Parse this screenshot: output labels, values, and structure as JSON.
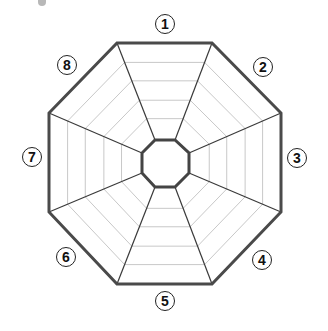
{
  "diagram": {
    "type": "octagonal radar chart template (blank)",
    "center": [
      165,
      163
    ],
    "outer_vertices": [
      [
        117,
        43
      ],
      [
        212,
        43
      ],
      [
        281,
        113
      ],
      [
        281,
        212
      ],
      [
        212,
        284
      ],
      [
        117,
        284
      ],
      [
        49,
        212
      ],
      [
        49,
        113
      ]
    ],
    "inner_vertices": [
      [
        155,
        140
      ],
      [
        175,
        140
      ],
      [
        189,
        153
      ],
      [
        189,
        173
      ],
      [
        175,
        187
      ],
      [
        155,
        187
      ],
      [
        142,
        173
      ],
      [
        142,
        153
      ]
    ],
    "grid_fractions": [
      0.22,
      0.41,
      0.61,
      0.8
    ],
    "colors": {
      "outline": "#4a4a4a",
      "spoke": "#3a3a3a",
      "grid": "#c8c8c8",
      "inner": "#444444"
    },
    "axes": [
      {
        "label": "①",
        "pos": [
          165,
          24
        ]
      },
      {
        "label": "②",
        "pos": [
          263,
          67
        ]
      },
      {
        "label": "③",
        "pos": [
          297,
          158
        ]
      },
      {
        "label": "④",
        "pos": [
          262,
          260
        ]
      },
      {
        "label": "⑤",
        "pos": [
          165,
          301
        ]
      },
      {
        "label": "⑥",
        "pos": [
          66,
          257
        ]
      },
      {
        "label": "⑦",
        "pos": [
          32,
          157
        ]
      },
      {
        "label": "⑧",
        "pos": [
          67,
          65
        ]
      }
    ],
    "label_text": [
      "1",
      "2",
      "3",
      "4",
      "5",
      "6",
      "7",
      "8"
    ]
  }
}
